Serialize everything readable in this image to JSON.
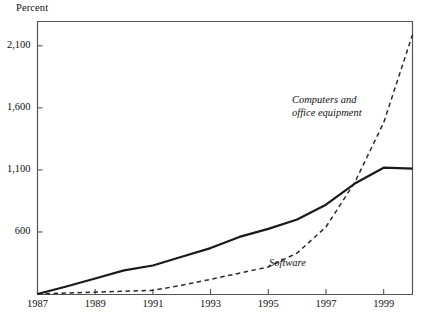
{
  "chart_data": {
    "type": "line",
    "title": "",
    "subtitle": "",
    "ylabel": "Percent",
    "xlabel": "",
    "xlim": [
      1987,
      2000
    ],
    "ylim": [
      100,
      2300
    ],
    "grid": false,
    "legend_position": "inline-annotations",
    "yticks": [
      600,
      1100,
      1600,
      2100
    ],
    "ytick_labels": [
      "600",
      "1,100",
      "1,600",
      "2,100"
    ],
    "xticks": [
      1987,
      1989,
      1991,
      1993,
      1995,
      1997,
      1999
    ],
    "xtick_labels": [
      "1987",
      "1989",
      "1991",
      "1993",
      "1995",
      "1997",
      "1999"
    ],
    "x": [
      1987,
      1988,
      1989,
      1990,
      1991,
      1992,
      1993,
      1994,
      1995,
      1996,
      1997,
      1998,
      1999,
      2000
    ],
    "series": [
      {
        "name": "Computers and office equipment",
        "style": "dashed",
        "color": "#2b2b2b",
        "label": "Computers and\noffice equipment",
        "label_line1": "Computers and",
        "label_line2": "office equipment",
        "values": [
          100,
          108,
          115,
          122,
          130,
          170,
          218,
          268,
          318,
          430,
          640,
          1000,
          1480,
          2190
        ]
      },
      {
        "name": "Software",
        "style": "solid",
        "color": "#1a1a1a",
        "label": "Software",
        "values": [
          100,
          160,
          225,
          290,
          330,
          400,
          470,
          560,
          625,
          700,
          820,
          990,
          1118,
          1110
        ]
      }
    ]
  },
  "annotations": {
    "computers_label_line1": "Computers and",
    "computers_label_line2": "office equipment",
    "software_label": "Software",
    "percent_label": "Percent"
  }
}
